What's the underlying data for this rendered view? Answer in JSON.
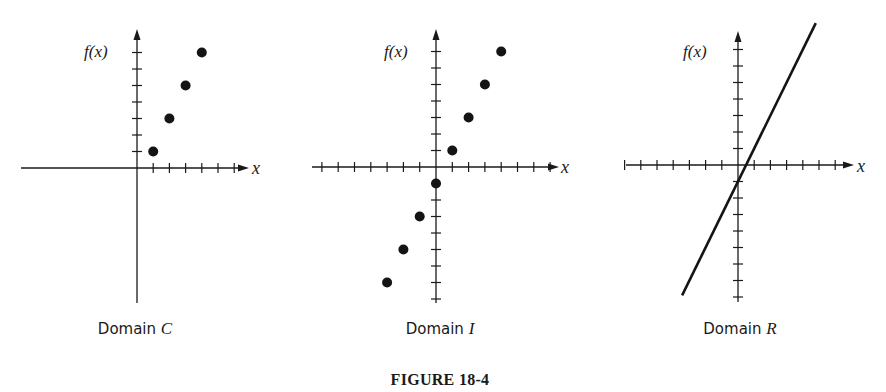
{
  "figure": {
    "title": "FIGURE 18-4"
  },
  "colors": {
    "ink": "#141414",
    "background": "#ffffff"
  },
  "panels": [
    {
      "caption": "Domain",
      "caption_var": "C",
      "ylabel": "f(x)",
      "xlabel": "x",
      "layout": {
        "origin": [
          137,
          168
        ],
        "unit": [
          16.2,
          16.5
        ],
        "xaxis": [
          21,
          249
        ],
        "yaxis": [
          29,
          303
        ],
        "xticks": [
          1,
          2,
          3,
          4,
          5,
          6
        ],
        "yticks": [
          1,
          2,
          3,
          4,
          5,
          6,
          7
        ],
        "caption_x": 135,
        "caption_y": 334,
        "ylabel_x": 84,
        "ylabel_y": 57,
        "xlabel_x": 252,
        "xlabel_y": 174
      }
    },
    {
      "caption": "Domain",
      "caption_var": "I",
      "ylabel": "f(x)",
      "xlabel": "x",
      "layout": {
        "origin": [
          436,
          167
        ],
        "unit": [
          16.3,
          16.5
        ],
        "xaxis": [
          312,
          559
        ],
        "yaxis": [
          29,
          303
        ],
        "xticks": [
          -7,
          -6,
          -5,
          -4,
          -3,
          -2,
          -1,
          1,
          2,
          3,
          4,
          5,
          6,
          7
        ],
        "yticks": [
          -8,
          -7,
          -6,
          -5,
          -4,
          -3,
          -2,
          -1,
          1,
          2,
          3,
          4,
          5,
          6,
          7
        ],
        "caption_x": 440,
        "caption_y": 334,
        "ylabel_x": 384,
        "ylabel_y": 57,
        "xlabel_x": 561,
        "xlabel_y": 173
      }
    },
    {
      "caption": "Domain",
      "caption_var": "R",
      "ylabel": "f(x)",
      "xlabel": "x",
      "layout": {
        "origin": [
          738,
          165
        ],
        "unit": [
          16.2,
          16.5
        ],
        "xaxis": [
          626,
          854
        ],
        "yaxis": [
          31,
          302
        ],
        "xticks": [
          -7,
          -6,
          -5,
          -4,
          -3,
          -2,
          -1,
          1,
          2,
          3,
          4,
          5,
          6
        ],
        "yticks": [
          -8,
          -7,
          -6,
          -5,
          -4,
          -3,
          -2,
          -1,
          1,
          2,
          3,
          4,
          5,
          6,
          7
        ],
        "caption_x": 740,
        "caption_y": 334,
        "ylabel_x": 683,
        "ylabel_y": 57,
        "xlabel_x": 857,
        "xlabel_y": 172,
        "line_x": [
          -3.45,
          4.8
        ]
      }
    }
  ],
  "chart_data": [
    {
      "type": "scatter",
      "title": "Domain C",
      "xlabel": "x",
      "ylabel": "f(x)",
      "function": "f(x) = 2x - 1",
      "domain": "C (counting numbers)",
      "x": [
        1,
        2,
        3,
        4
      ],
      "y": [
        1,
        3,
        5,
        7
      ],
      "xlim": [
        -7,
        6
      ],
      "ylim": [
        -8,
        8
      ],
      "grid": false,
      "legend": null
    },
    {
      "type": "scatter",
      "title": "Domain I",
      "xlabel": "x",
      "ylabel": "f(x)",
      "function": "f(x) = 2x - 1",
      "domain": "I (integers)",
      "x": [
        -3,
        -2,
        -1,
        0,
        1,
        2,
        3,
        4
      ],
      "y": [
        -7,
        -5,
        -3,
        -1,
        1,
        3,
        5,
        7
      ],
      "xlim": [
        -7,
        7
      ],
      "ylim": [
        -8,
        8
      ],
      "grid": false,
      "legend": null
    },
    {
      "type": "line",
      "title": "Domain R",
      "xlabel": "x",
      "ylabel": "f(x)",
      "function": "f(x) = 2x - 1",
      "domain": "R (real numbers)",
      "x": [
        -3.45,
        4.8
      ],
      "y": [
        -7.9,
        8.6
      ],
      "xlim": [
        -7,
        7
      ],
      "ylim": [
        -8,
        8
      ],
      "grid": false,
      "legend": null
    }
  ]
}
